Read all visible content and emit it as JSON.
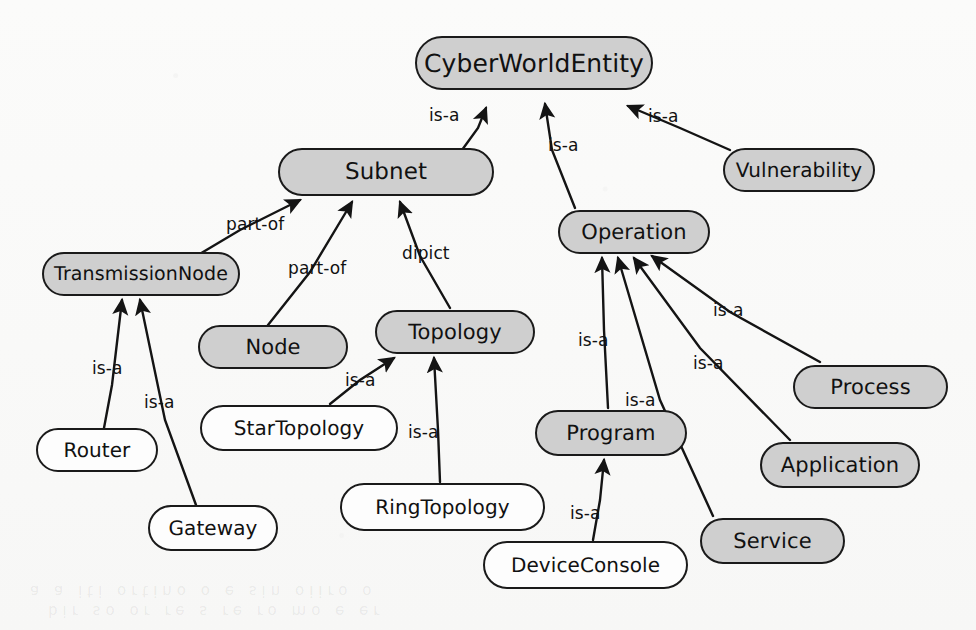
{
  "diagram": {
    "type": "ontology-class-hierarchy",
    "canvas": {
      "width": 976,
      "height": 630
    },
    "colors": {
      "node_fill_gray": "#cfcfcf",
      "node_fill_white": "#fdfdfd",
      "node_stroke": "#1a1a1a",
      "edge_stroke": "#141414",
      "text": "#111111",
      "background": "#f9f9f8"
    },
    "nodes": [
      {
        "id": "cyberworldentity",
        "label": "CyberWorldEntity",
        "fill": "gray",
        "x": 415,
        "y": 36,
        "w": 238,
        "h": 54,
        "font": 25
      },
      {
        "id": "subnet",
        "label": "Subnet",
        "fill": "gray",
        "x": 278,
        "y": 148,
        "w": 216,
        "h": 48,
        "font": 23
      },
      {
        "id": "vulnerability",
        "label": "Vulnerability",
        "fill": "gray",
        "x": 723,
        "y": 148,
        "w": 152,
        "h": 44,
        "font": 20
      },
      {
        "id": "operation",
        "label": "Operation",
        "fill": "gray",
        "x": 558,
        "y": 210,
        "w": 152,
        "h": 44,
        "font": 21
      },
      {
        "id": "transmissionnode",
        "label": "TransmissionNode",
        "fill": "gray",
        "x": 42,
        "y": 252,
        "w": 198,
        "h": 44,
        "font": 19
      },
      {
        "id": "topology",
        "label": "Topology",
        "fill": "gray",
        "x": 375,
        "y": 310,
        "w": 160,
        "h": 44,
        "font": 21
      },
      {
        "id": "node",
        "label": "Node",
        "fill": "gray",
        "x": 198,
        "y": 325,
        "w": 150,
        "h": 44,
        "font": 21
      },
      {
        "id": "process",
        "label": "Process",
        "fill": "gray",
        "x": 793,
        "y": 365,
        "w": 155,
        "h": 44,
        "font": 21
      },
      {
        "id": "startopology",
        "label": "StarTopology",
        "fill": "white",
        "x": 200,
        "y": 405,
        "w": 198,
        "h": 46,
        "font": 20
      },
      {
        "id": "router",
        "label": "Router",
        "fill": "white",
        "x": 36,
        "y": 428,
        "w": 122,
        "h": 44,
        "font": 20
      },
      {
        "id": "program",
        "label": "Program",
        "fill": "gray",
        "x": 535,
        "y": 410,
        "w": 152,
        "h": 46,
        "font": 21
      },
      {
        "id": "application",
        "label": "Application",
        "fill": "gray",
        "x": 760,
        "y": 442,
        "w": 160,
        "h": 46,
        "font": 21
      },
      {
        "id": "ringtopology",
        "label": "RingTopology",
        "fill": "white",
        "x": 340,
        "y": 483,
        "w": 205,
        "h": 48,
        "font": 20
      },
      {
        "id": "service",
        "label": "Service",
        "fill": "gray",
        "x": 700,
        "y": 518,
        "w": 145,
        "h": 46,
        "font": 21
      },
      {
        "id": "gateway",
        "label": "Gateway",
        "fill": "white",
        "x": 148,
        "y": 505,
        "w": 130,
        "h": 46,
        "font": 20
      },
      {
        "id": "deviceconsole",
        "label": "DeviceConsole",
        "fill": "white",
        "x": 483,
        "y": 541,
        "w": 205,
        "h": 48,
        "font": 20
      }
    ],
    "edges": [
      {
        "id": "e1",
        "from": "subnet",
        "to": "cyberworldentity",
        "label": "is-a",
        "path": "M 462 150 L 478 128 L 486 108",
        "label_x": 429,
        "label_y": 105
      },
      {
        "id": "e2",
        "from": "operation",
        "to": "cyberworldentity",
        "label": "is-a",
        "path": "M 575 208 L 552 150 L 545 104",
        "label_x": 548,
        "label_y": 135
      },
      {
        "id": "e3",
        "from": "vulnerability",
        "to": "cyberworldentity",
        "label": "is-a",
        "path": "M 730 150 L 680 128 L 628 106",
        "label_x": 648,
        "label_y": 106
      },
      {
        "id": "e4",
        "from": "transmissionnode",
        "to": "subnet",
        "label": "part-of",
        "path": "M 198 255 L 240 230 L 300 200",
        "label_x": 226,
        "label_y": 214
      },
      {
        "id": "e5",
        "from": "node",
        "to": "subnet",
        "label": "part-of",
        "path": "M 268 325 L 310 272 L 352 202",
        "label_x": 288,
        "label_y": 258
      },
      {
        "id": "e6",
        "from": "topology",
        "to": "subnet",
        "label": "dipict",
        "path": "M 450 308 L 420 256 L 400 202",
        "label_x": 402,
        "label_y": 243
      },
      {
        "id": "e7",
        "from": "router",
        "to": "transmissionnode",
        "label": "is-a",
        "path": "M 104 428 L 112 385 L 122 300",
        "label_x": 92,
        "label_y": 358
      },
      {
        "id": "e8",
        "from": "gateway",
        "to": "transmissionnode",
        "label": "is-a",
        "path": "M 196 505 L 165 420 L 140 300",
        "label_x": 144,
        "label_y": 392
      },
      {
        "id": "e9",
        "from": "startopology",
        "to": "topology",
        "label": "is-a",
        "path": "M 330 404 L 360 380 L 394 358",
        "label_x": 345,
        "label_y": 370
      },
      {
        "id": "e10",
        "from": "ringtopology",
        "to": "topology",
        "label": "is-a",
        "path": "M 440 482 L 438 430 L 434 358",
        "label_x": 408,
        "label_y": 422
      },
      {
        "id": "e11",
        "from": "program",
        "to": "operation",
        "label": "is-a",
        "path": "M 608 408 L 604 330 L 602 258",
        "label_x": 578,
        "label_y": 330
      },
      {
        "id": "e12",
        "from": "service",
        "to": "operation",
        "label": "is-a",
        "path": "M 713 516 L 660 400 L 618 258",
        "label_x": 625,
        "label_y": 390
      },
      {
        "id": "e13",
        "from": "application",
        "to": "operation",
        "label": "is-a",
        "path": "M 790 440 L 700 348 L 634 258",
        "label_x": 693,
        "label_y": 353
      },
      {
        "id": "e14",
        "from": "process",
        "to": "operation",
        "label": "is-a",
        "path": "M 820 362 L 730 312 L 652 256",
        "label_x": 713,
        "label_y": 300
      },
      {
        "id": "e15",
        "from": "deviceconsole",
        "to": "program",
        "label": "is-a",
        "path": "M 593 540 L 600 500 L 604 460",
        "label_x": 570,
        "label_y": 503
      }
    ],
    "watermark_lines": [
      "a a  iti  ortino  o e  sin  oiiro o",
      "bir  so  or  re   s re  ro  mo  e  er"
    ]
  }
}
